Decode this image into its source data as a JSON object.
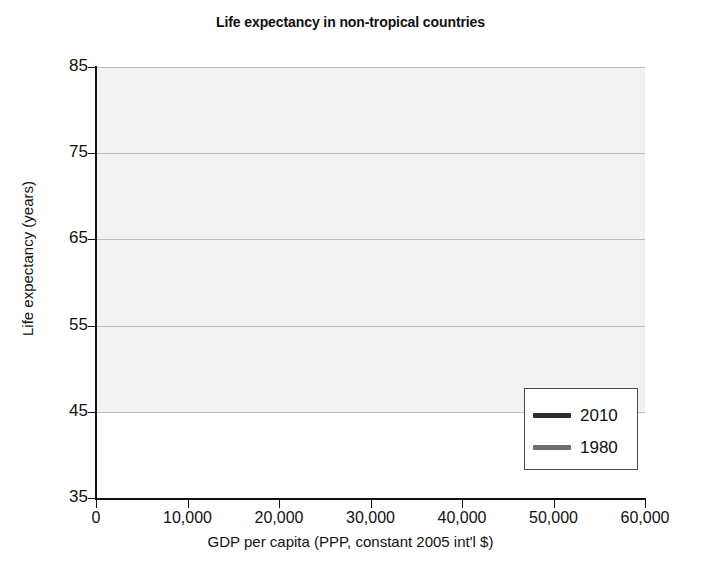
{
  "chart_data": {
    "type": "scatter",
    "title": "Life expectancy in non-tropical countries",
    "xlabel": "GDP per capita (PPP, constant 2005 int'l $)",
    "ylabel": "Life expectancy (years)",
    "xlim": [
      0,
      60000
    ],
    "ylim": [
      35,
      85
    ],
    "xticks": [
      0,
      10000,
      20000,
      30000,
      40000,
      50000,
      60000
    ],
    "xtick_labels": [
      "0",
      "10,000",
      "20,000",
      "30,000",
      "40,000",
      "50,000",
      "60,000"
    ],
    "yticks": [
      35,
      45,
      55,
      65,
      75,
      85
    ],
    "ytick_labels": [
      "35",
      "45",
      "55",
      "65",
      "75",
      "85"
    ],
    "grid": "horizontal",
    "legend_position": "bottom-right",
    "colors": {
      "series_2010": "#2b2b2b",
      "series_1980": "#6e6e6e",
      "plot_background": "#f2f2f2",
      "gridline": "#bcbcbc",
      "axis": "#111111"
    },
    "series": [
      {
        "name": "2010",
        "marker": "diamond",
        "color": "#2b2b2b",
        "points": [
          [
            400,
            48.5
          ],
          [
            500,
            47.0
          ],
          [
            900,
            66.5
          ],
          [
            1100,
            66.0
          ],
          [
            1500,
            69.5
          ],
          [
            1700,
            67.0
          ],
          [
            2100,
            64.5
          ],
          [
            2300,
            67.5
          ],
          [
            2600,
            70.0
          ],
          [
            2900,
            66.0
          ],
          [
            3000,
            68.5
          ],
          [
            3200,
            71.5
          ],
          [
            3400,
            71.0
          ],
          [
            3600,
            73.5
          ],
          [
            3800,
            72.5
          ],
          [
            4000,
            70.5
          ],
          [
            4200,
            72.0
          ],
          [
            4400,
            74.0
          ],
          [
            4600,
            65.5
          ],
          [
            4900,
            48.0
          ],
          [
            5200,
            72.5
          ],
          [
            5500,
            76.0
          ],
          [
            5800,
            73.0
          ],
          [
            6100,
            71.5
          ],
          [
            6400,
            74.5
          ],
          [
            6800,
            46.5
          ],
          [
            7000,
            75.0
          ],
          [
            7300,
            73.5
          ],
          [
            7600,
            76.5
          ],
          [
            8000,
            74.0
          ],
          [
            8400,
            75.5
          ],
          [
            8800,
            63.5
          ],
          [
            9200,
            76.0
          ],
          [
            9600,
            75.0
          ],
          [
            10000,
            77.0
          ],
          [
            10500,
            74.5
          ],
          [
            11000,
            76.5
          ],
          [
            11500,
            75.5
          ],
          [
            12000,
            78.0
          ],
          [
            12500,
            76.0
          ],
          [
            13000,
            77.5
          ],
          [
            13500,
            74.0
          ],
          [
            14000,
            79.0
          ],
          [
            14500,
            76.5
          ],
          [
            15000,
            78.5
          ],
          [
            15500,
            75.0
          ],
          [
            16000,
            77.0
          ],
          [
            16500,
            79.5
          ],
          [
            17000,
            76.0
          ],
          [
            17500,
            78.0
          ],
          [
            18000,
            80.0
          ],
          [
            18500,
            77.0
          ],
          [
            19000,
            79.0
          ],
          [
            19500,
            75.5
          ],
          [
            20000,
            78.5
          ],
          [
            20500,
            80.5
          ],
          [
            21000,
            77.5
          ],
          [
            22000,
            79.5
          ],
          [
            22500,
            81.0
          ],
          [
            23000,
            78.0
          ],
          [
            23500,
            82.5
          ],
          [
            24000,
            80.0
          ],
          [
            24500,
            81.5
          ],
          [
            25000,
            79.0
          ],
          [
            25500,
            82.0
          ],
          [
            26000,
            80.5
          ],
          [
            26500,
            83.0
          ],
          [
            27000,
            81.0
          ],
          [
            27500,
            79.5
          ],
          [
            28000,
            82.5
          ],
          [
            28500,
            80.0
          ],
          [
            29000,
            81.5
          ],
          [
            29500,
            83.5
          ],
          [
            30000,
            80.5
          ],
          [
            31000,
            82.0
          ],
          [
            32000,
            71.5
          ],
          [
            33000,
            81.0
          ],
          [
            34000,
            69.5
          ],
          [
            35000,
            82.5
          ],
          [
            36000,
            80.5
          ],
          [
            36500,
            83.0
          ],
          [
            37000,
            81.5
          ],
          [
            38000,
            82.0
          ],
          [
            38500,
            80.0
          ],
          [
            39000,
            83.0
          ],
          [
            40000,
            81.0
          ],
          [
            41000,
            82.5
          ],
          [
            42000,
            80.5
          ],
          [
            43000,
            74.5
          ],
          [
            44000,
            83.0
          ],
          [
            46000,
            81.5
          ],
          [
            48000,
            82.0
          ],
          [
            58000,
            81.5
          ]
        ]
      },
      {
        "name": "1980",
        "marker": "square",
        "color": "#6e6e6e",
        "points": [
          [
            300,
            54.0
          ],
          [
            400,
            66.5
          ],
          [
            600,
            58.5
          ],
          [
            800,
            57.0
          ],
          [
            1000,
            55.5
          ],
          [
            1300,
            60.0
          ],
          [
            1600,
            58.0
          ],
          [
            1900,
            62.5
          ],
          [
            2200,
            64.5
          ],
          [
            2400,
            61.0
          ],
          [
            2700,
            66.5
          ],
          [
            3000,
            67.5
          ],
          [
            3300,
            63.5
          ],
          [
            3600,
            56.0
          ],
          [
            3900,
            65.5
          ],
          [
            4200,
            68.0
          ],
          [
            4500,
            66.0
          ],
          [
            4800,
            55.5
          ],
          [
            5100,
            69.0
          ],
          [
            5400,
            67.0
          ],
          [
            5700,
            64.5
          ],
          [
            6000,
            69.5
          ],
          [
            6300,
            58.5
          ],
          [
            6600,
            70.0
          ],
          [
            6900,
            68.5
          ],
          [
            7200,
            52.0
          ],
          [
            7500,
            66.5
          ],
          [
            7800,
            70.5
          ],
          [
            8200,
            69.0
          ],
          [
            8600,
            52.0
          ],
          [
            9000,
            71.0
          ],
          [
            9500,
            68.0
          ],
          [
            10000,
            71.5
          ],
          [
            10500,
            66.5
          ],
          [
            11000,
            72.0
          ],
          [
            11500,
            70.0
          ],
          [
            12000,
            69.0
          ],
          [
            12500,
            73.0
          ],
          [
            13000,
            71.0
          ],
          [
            13500,
            67.5
          ],
          [
            14000,
            72.5
          ],
          [
            14500,
            70.5
          ],
          [
            15000,
            74.0
          ],
          [
            15500,
            72.0
          ],
          [
            16000,
            73.5
          ],
          [
            16500,
            69.5
          ],
          [
            17000,
            74.5
          ],
          [
            17500,
            71.5
          ],
          [
            18000,
            73.0
          ],
          [
            18500,
            75.0
          ],
          [
            19000,
            72.0
          ],
          [
            19500,
            74.0
          ],
          [
            20000,
            66.0
          ],
          [
            20500,
            73.5
          ],
          [
            21000,
            75.5
          ],
          [
            21500,
            70.0
          ],
          [
            22000,
            74.5
          ],
          [
            23000,
            72.5
          ],
          [
            24000,
            75.0
          ],
          [
            25000,
            73.5
          ],
          [
            26000,
            74.0
          ],
          [
            27000,
            71.0
          ],
          [
            28000,
            75.0
          ],
          [
            29000,
            74.5
          ],
          [
            30000,
            73.0
          ],
          [
            32000,
            74.0
          ],
          [
            35000,
            62.5
          ],
          [
            38000,
            75.0
          ],
          [
            41000,
            71.5
          ],
          [
            44000,
            75.5
          ],
          [
            47000,
            75.0
          ]
        ]
      }
    ],
    "trend_lines": [
      {
        "name": "2010",
        "color": "#2b2b2b",
        "start": [
          300,
          57.5
        ],
        "end": [
          60000,
          82.5
        ]
      },
      {
        "name": "1980",
        "color": "#6e6e6e",
        "start": [
          250,
          54.5
        ],
        "end": [
          60000,
          76.5
        ]
      }
    ]
  },
  "legend": {
    "entries": [
      {
        "label": "2010",
        "color": "#2b2b2b"
      },
      {
        "label": "1980",
        "color": "#6e6e6e"
      }
    ]
  }
}
